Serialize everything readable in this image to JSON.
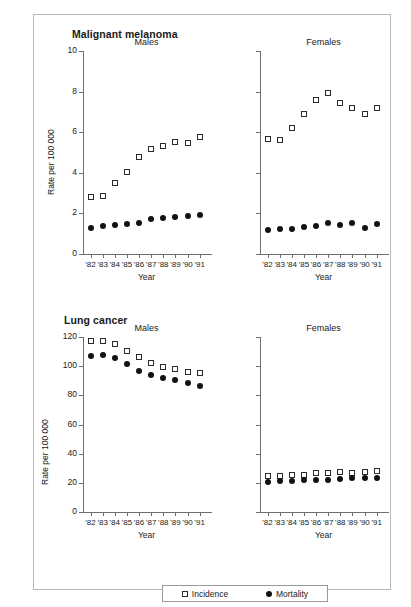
{
  "figure": {
    "sections": [
      {
        "id": "melanoma",
        "title": "Malignant melanoma"
      },
      {
        "id": "lung",
        "title": "Lung cancer"
      }
    ],
    "axis_title_y": "Rate per 100 000",
    "axis_title_x": "Year",
    "legend": {
      "incidence_label": "Incidence",
      "mortality_label": "Mortality",
      "incidence_marker": "open-square-icon",
      "mortality_marker": "filled-circle-icon"
    },
    "panel_titles": {
      "males": "Males",
      "females": "Females"
    }
  },
  "chart_data": [
    {
      "type": "scatter",
      "id": "melanoma-males",
      "title": "Malignant melanoma",
      "subtitle": "Males",
      "xlabel": "Year",
      "ylabel": "Rate per 100 000",
      "x": [
        "'82",
        "'83",
        "'84",
        "'85",
        "'86",
        "'87",
        "'88",
        "'89",
        "'90",
        "'91"
      ],
      "ylim": [
        0,
        10
      ],
      "yticks": [
        0,
        2,
        4,
        6,
        8,
        10
      ],
      "grid": false,
      "legend_position": "bottom",
      "series": [
        {
          "name": "Incidence",
          "marker": "open-square",
          "values": [
            2.8,
            2.85,
            3.5,
            4.05,
            4.8,
            5.15,
            5.3,
            5.5,
            5.45,
            5.75
          ]
        },
        {
          "name": "Mortality",
          "marker": "filled-circle",
          "values": [
            1.3,
            1.4,
            1.45,
            1.5,
            1.55,
            1.7,
            1.75,
            1.8,
            1.85,
            1.9
          ]
        }
      ]
    },
    {
      "type": "scatter",
      "id": "melanoma-females",
      "title": "Malignant melanoma",
      "subtitle": "Females",
      "xlabel": "Year",
      "ylabel": "Rate per 100 000",
      "x": [
        "'82",
        "'83",
        "'84",
        "'85",
        "'86",
        "'87",
        "'88",
        "'89",
        "'90",
        "'91"
      ],
      "ylim": [
        0,
        10
      ],
      "yticks": [
        0,
        2,
        4,
        6,
        8,
        10
      ],
      "grid": false,
      "legend_position": "bottom",
      "series": [
        {
          "name": "Incidence",
          "marker": "open-square",
          "values": [
            5.65,
            5.6,
            6.2,
            6.9,
            7.6,
            7.95,
            7.45,
            7.2,
            6.9,
            7.2
          ]
        },
        {
          "name": "Mortality",
          "marker": "filled-circle",
          "values": [
            1.2,
            1.25,
            1.25,
            1.35,
            1.4,
            1.55,
            1.45,
            1.55,
            1.3,
            1.5
          ]
        }
      ]
    },
    {
      "type": "scatter",
      "id": "lung-males",
      "title": "Lung cancer",
      "subtitle": "Males",
      "xlabel": "Year",
      "ylabel": "Rate per 100 000",
      "x": [
        "'82",
        "'83",
        "'84",
        "'85",
        "'86",
        "'87",
        "'88",
        "'89",
        "'90",
        "'91"
      ],
      "ylim": [
        0,
        120
      ],
      "yticks": [
        0,
        20,
        40,
        60,
        80,
        100,
        120
      ],
      "grid": false,
      "legend_position": "bottom",
      "series": [
        {
          "name": "Incidence",
          "marker": "open-square",
          "values": [
            117.5,
            117,
            115,
            110.5,
            106,
            102.5,
            99.5,
            98,
            96,
            95
          ]
        },
        {
          "name": "Mortality",
          "marker": "filled-circle",
          "values": [
            107,
            107.5,
            105.5,
            101.5,
            97,
            94,
            92,
            90.5,
            88.5,
            86.5
          ]
        }
      ]
    },
    {
      "type": "scatter",
      "id": "lung-females",
      "title": "Lung cancer",
      "subtitle": "Females",
      "xlabel": "Year",
      "ylabel": "Rate per 100 000",
      "x": [
        "'82",
        "'83",
        "'84",
        "'85",
        "'86",
        "'87",
        "'88",
        "'89",
        "'90",
        "'91"
      ],
      "ylim": [
        0,
        120
      ],
      "yticks": [
        0,
        20,
        40,
        60,
        80,
        100,
        120
      ],
      "grid": false,
      "legend_position": "bottom",
      "series": [
        {
          "name": "Incidence",
          "marker": "open-square",
          "values": [
            24.5,
            24.5,
            25.5,
            25.5,
            26.5,
            27,
            27.5,
            27,
            27.5,
            28
          ]
        },
        {
          "name": "Mortality",
          "marker": "filled-circle",
          "values": [
            20.5,
            21,
            21.5,
            22,
            22,
            22,
            22.5,
            23,
            23,
            23.5
          ]
        }
      ]
    }
  ]
}
